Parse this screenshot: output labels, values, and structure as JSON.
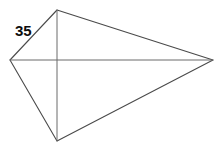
{
  "figure": {
    "kind": "geometry-diagram",
    "shape_name": "kite",
    "background_color": "#ffffff",
    "edge_color": "#4a4a4a",
    "diagonal_color": "#6a6a6a",
    "label_color": "#0d0d0d",
    "canvas": {
      "width": 221,
      "height": 149
    },
    "vertices": [
      {
        "id": "left",
        "x": 10,
        "y": 60
      },
      {
        "id": "top",
        "x": 57,
        "y": 10
      },
      {
        "id": "right",
        "x": 213,
        "y": 60
      },
      {
        "id": "bottom",
        "x": 57,
        "y": 141
      }
    ],
    "outline_path": "M 10 60 L 57 10 L 213 60 L 57 141 Z",
    "diagonals": [
      {
        "id": "horizontal-diagonal",
        "from": "left",
        "to": "right",
        "path": "M 10 60 L 213 60"
      },
      {
        "id": "vertical-diagonal",
        "from": "top",
        "to": "bottom",
        "path": "M 57 10 L 57 141"
      }
    ],
    "diagonal_intersection": {
      "x": 57,
      "y": 60
    },
    "labels": [
      {
        "id": "side-label-35",
        "text": "35",
        "labels_edge": "left-to-top",
        "x": 15,
        "y": 23
      }
    ]
  }
}
